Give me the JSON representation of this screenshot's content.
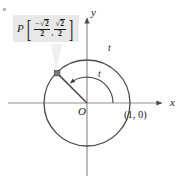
{
  "figure": {
    "background_color": "#ffffff",
    "stroke_color": "#3a3a3a",
    "axis_color": "#8a8a8a",
    "text_color": "#1a1a1a",
    "callout_bg": "#e8e8e8"
  },
  "axes": {
    "x_label": "x",
    "y_label": "y",
    "origin_label": "O"
  },
  "labels": {
    "arc_label": "t",
    "angle_label": "t",
    "point_on_axis": "(1, 0)"
  },
  "callout": {
    "point_name": "P",
    "left_bracket": "[",
    "right_bracket": "]",
    "separator": ",",
    "x_sign": "−",
    "x_numerator_radical": "√",
    "x_numerator_radicand": "2",
    "x_denominator": "2",
    "y_numerator_radical": "√",
    "y_numerator_radicand": "2",
    "y_denominator": "2",
    "x_value": "−√2/2",
    "y_value": "√2/2"
  },
  "geometry": {
    "center_x": 87,
    "center_y": 103,
    "radius": 43,
    "point_angle_degrees": 135,
    "point_x": 57,
    "point_y": 73,
    "angle_arc_radius": 26
  }
}
